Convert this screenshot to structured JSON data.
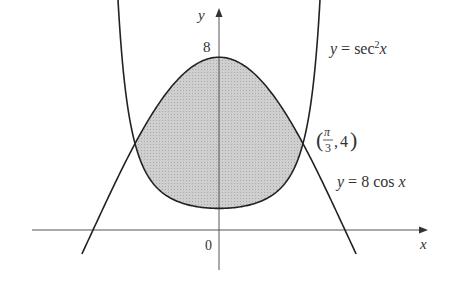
{
  "figure": {
    "type": "region-between-curves",
    "origin_px": [
      219,
      230
    ],
    "scale_px_per_unit": {
      "x": 80.2,
      "y": 21.6
    },
    "colors": {
      "curve": "#222222",
      "axis": "#555555",
      "fill": "#c8c8c8",
      "label": "#333333"
    }
  },
  "axes": {
    "x_label": "x",
    "y_label": "y",
    "origin_label": "0",
    "y_tick_label": "8"
  },
  "curves": [
    {
      "name": "sec-squared",
      "label_prefix": "y = sec",
      "label_sup": "2",
      "label_suffix": "x",
      "x_range": [
        -1.28,
        1.28
      ]
    },
    {
      "name": "eight-cos",
      "label": "y = 8 cos x",
      "x_range": [
        -1.71,
        1.71
      ]
    }
  ],
  "intersection": {
    "label_num": "π",
    "label_den": "3",
    "label_y": "4",
    "point": [
      "π/3",
      4
    ]
  },
  "shaded_region": {
    "x_range": [
      "-π/3",
      "π/3"
    ],
    "between": [
      "sec²x",
      "8 cos x"
    ]
  }
}
